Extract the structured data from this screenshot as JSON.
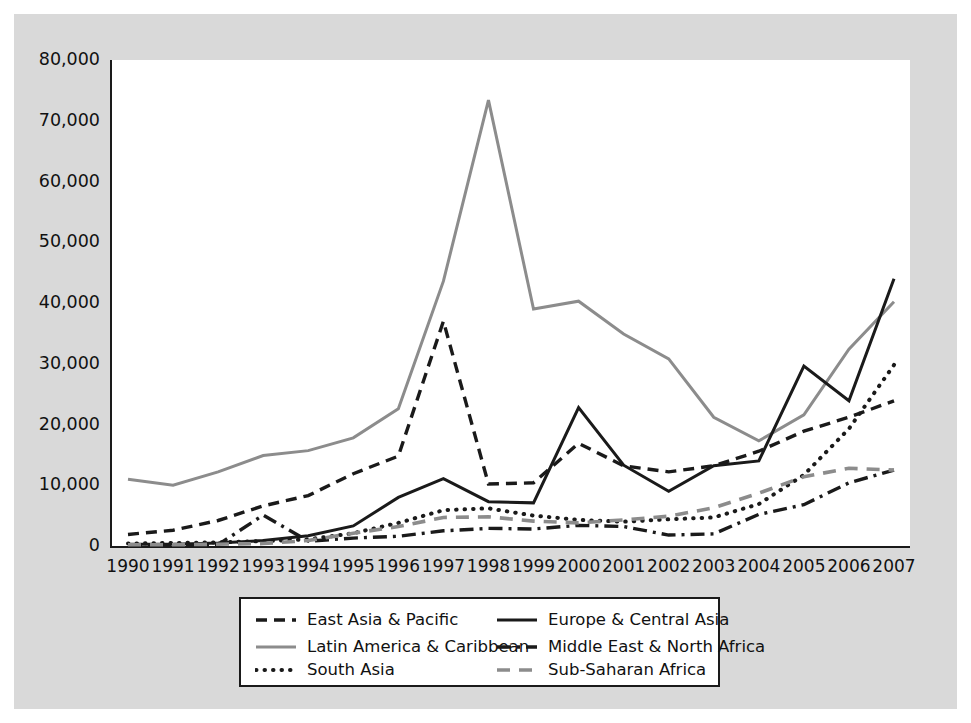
{
  "chart_data": {
    "type": "line",
    "title": "",
    "xlabel": "",
    "ylabel": "",
    "x": [
      "1990",
      "1991",
      "1992",
      "1993",
      "1994",
      "1995",
      "1996",
      "1997",
      "1998",
      "1999",
      "2000",
      "2001",
      "2002",
      "2003",
      "2004",
      "2005",
      "2006",
      "2007"
    ],
    "ylim": [
      0,
      80000
    ],
    "ytick_labels": [
      "0",
      "10,000",
      "20,000",
      "30,000",
      "40,000",
      "50,000",
      "60,000",
      "70,000",
      "80,000"
    ],
    "ytick_values": [
      0,
      10000,
      20000,
      30000,
      40000,
      50000,
      60000,
      70000,
      80000
    ],
    "grid": false,
    "legend_position": "bottom",
    "series": [
      {
        "name": "East Asia & Pacific",
        "style": "dashed",
        "color": "#1a1a1a",
        "values": [
          1900,
          2600,
          4200,
          6600,
          8300,
          11900,
          14800,
          37000,
          10200,
          10400,
          16900,
          13200,
          12200,
          13200,
          15600,
          18900,
          21200,
          23900
        ]
      },
      {
        "name": "Latin America & Caribbean",
        "style": "solid",
        "color": "#8c8c8c",
        "values": [
          11000,
          10000,
          12200,
          14900,
          15700,
          17800,
          22600,
          43600,
          73400,
          39000,
          40300,
          34900,
          30800,
          21200,
          17300,
          21600,
          32400,
          40200
        ]
      },
      {
        "name": "South Asia",
        "style": "dotted",
        "color": "#1a1a1a",
        "values": [
          400,
          500,
          600,
          800,
          1100,
          2100,
          3800,
          5900,
          6200,
          5000,
          4300,
          4000,
          4400,
          4700,
          6900,
          11700,
          19300,
          29800
        ]
      },
      {
        "name": "Europe & Central Asia",
        "style": "solid",
        "color": "#1a1a1a",
        "values": [
          300,
          300,
          500,
          900,
          1700,
          3300,
          8000,
          11100,
          7300,
          7100,
          22800,
          13300,
          9000,
          13200,
          14000,
          29600,
          23900,
          44000
        ]
      },
      {
        "name": "Middle East & North Africa",
        "style": "dashdot",
        "color": "#1a1a1a",
        "values": [
          100,
          100,
          200,
          5100,
          800,
          1300,
          1600,
          2500,
          2900,
          2800,
          3400,
          3200,
          1800,
          2000,
          5200,
          6800,
          10400,
          12500
        ]
      },
      {
        "name": "Sub-Saharan Africa",
        "style": "longdash",
        "color": "#8c8c8c",
        "values": [
          200,
          200,
          300,
          400,
          900,
          2100,
          3200,
          4700,
          4800,
          4100,
          3800,
          4300,
          4900,
          6300,
          8700,
          11400,
          12800,
          12500
        ]
      }
    ]
  },
  "axis": {
    "y_labels": [
      "80,000",
      "70,000",
      "60,000",
      "50,000",
      "40,000",
      "30,000",
      "20,000",
      "10,000",
      "0"
    ],
    "x_labels": [
      "1990",
      "1991",
      "1992",
      "1993",
      "1994",
      "1995",
      "1996",
      "1997",
      "1998",
      "1999",
      "2000",
      "2001",
      "2002",
      "2003",
      "2004",
      "2005",
      "2006",
      "2007"
    ]
  },
  "legend": {
    "entries": [
      {
        "label": "East Asia & Pacific",
        "swatch": "dashed-line-swatch"
      },
      {
        "label": "Europe & Central Asia",
        "swatch": "solid-black-line-swatch"
      },
      {
        "label": "Latin America & Caribbean",
        "swatch": "solid-gray-line-swatch"
      },
      {
        "label": "Middle East & North Africa",
        "swatch": "dash-dot-line-swatch"
      },
      {
        "label": "South Asia",
        "swatch": "dotted-line-swatch"
      },
      {
        "label": "Sub-Saharan Africa",
        "swatch": "long-dash-gray-line-swatch"
      }
    ]
  }
}
